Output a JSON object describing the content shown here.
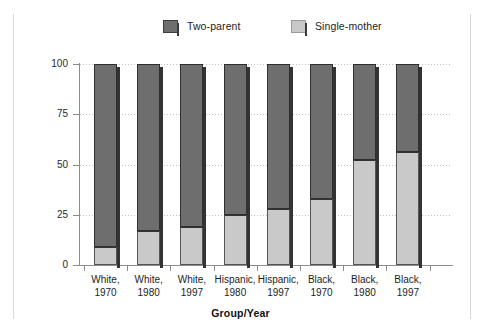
{
  "chart_data": {
    "type": "bar",
    "subtype": "stacked-100-percent",
    "title": "",
    "xlabel": "Group/Year",
    "ylabel": "Percent",
    "ylim": [
      0,
      100
    ],
    "yticks": [
      0,
      25,
      50,
      75,
      100
    ],
    "ytick_labels": [
      "0",
      "25",
      "50",
      "75",
      "100"
    ],
    "grid": true,
    "grid_axis": "y",
    "legend_position": "top-center",
    "categories": [
      "White, 1970",
      "White, 1980",
      "White, 1997",
      "Hispanic, 1980",
      "Hispanic, 1997",
      "Black, 1970",
      "Black, 1980",
      "Black, 1997"
    ],
    "category_lines": [
      [
        "White,",
        "1970"
      ],
      [
        "White,",
        "1980"
      ],
      [
        "White,",
        "1997"
      ],
      [
        "Hispanic,",
        "1980"
      ],
      [
        "Hispanic,",
        "1997"
      ],
      [
        "Black,",
        "1970"
      ],
      [
        "Black,",
        "1980"
      ],
      [
        "Black,",
        "1997"
      ]
    ],
    "series": [
      {
        "name": "Single-mother",
        "color": "#c9c9c9",
        "values": [
          9,
          17,
          19,
          25,
          28,
          33,
          52,
          56
        ]
      },
      {
        "name": "Two-parent",
        "color": "#6e6e6e",
        "values": [
          91,
          83,
          81,
          75,
          72,
          67,
          48,
          44
        ]
      }
    ]
  },
  "legend": {
    "items": [
      {
        "label": "Two-parent",
        "color": "#6e6e6e"
      },
      {
        "label": "Single-mother",
        "color": "#c9c9c9"
      }
    ]
  },
  "axes": {
    "y_title": "Percent",
    "x_title": "Group/Year"
  }
}
